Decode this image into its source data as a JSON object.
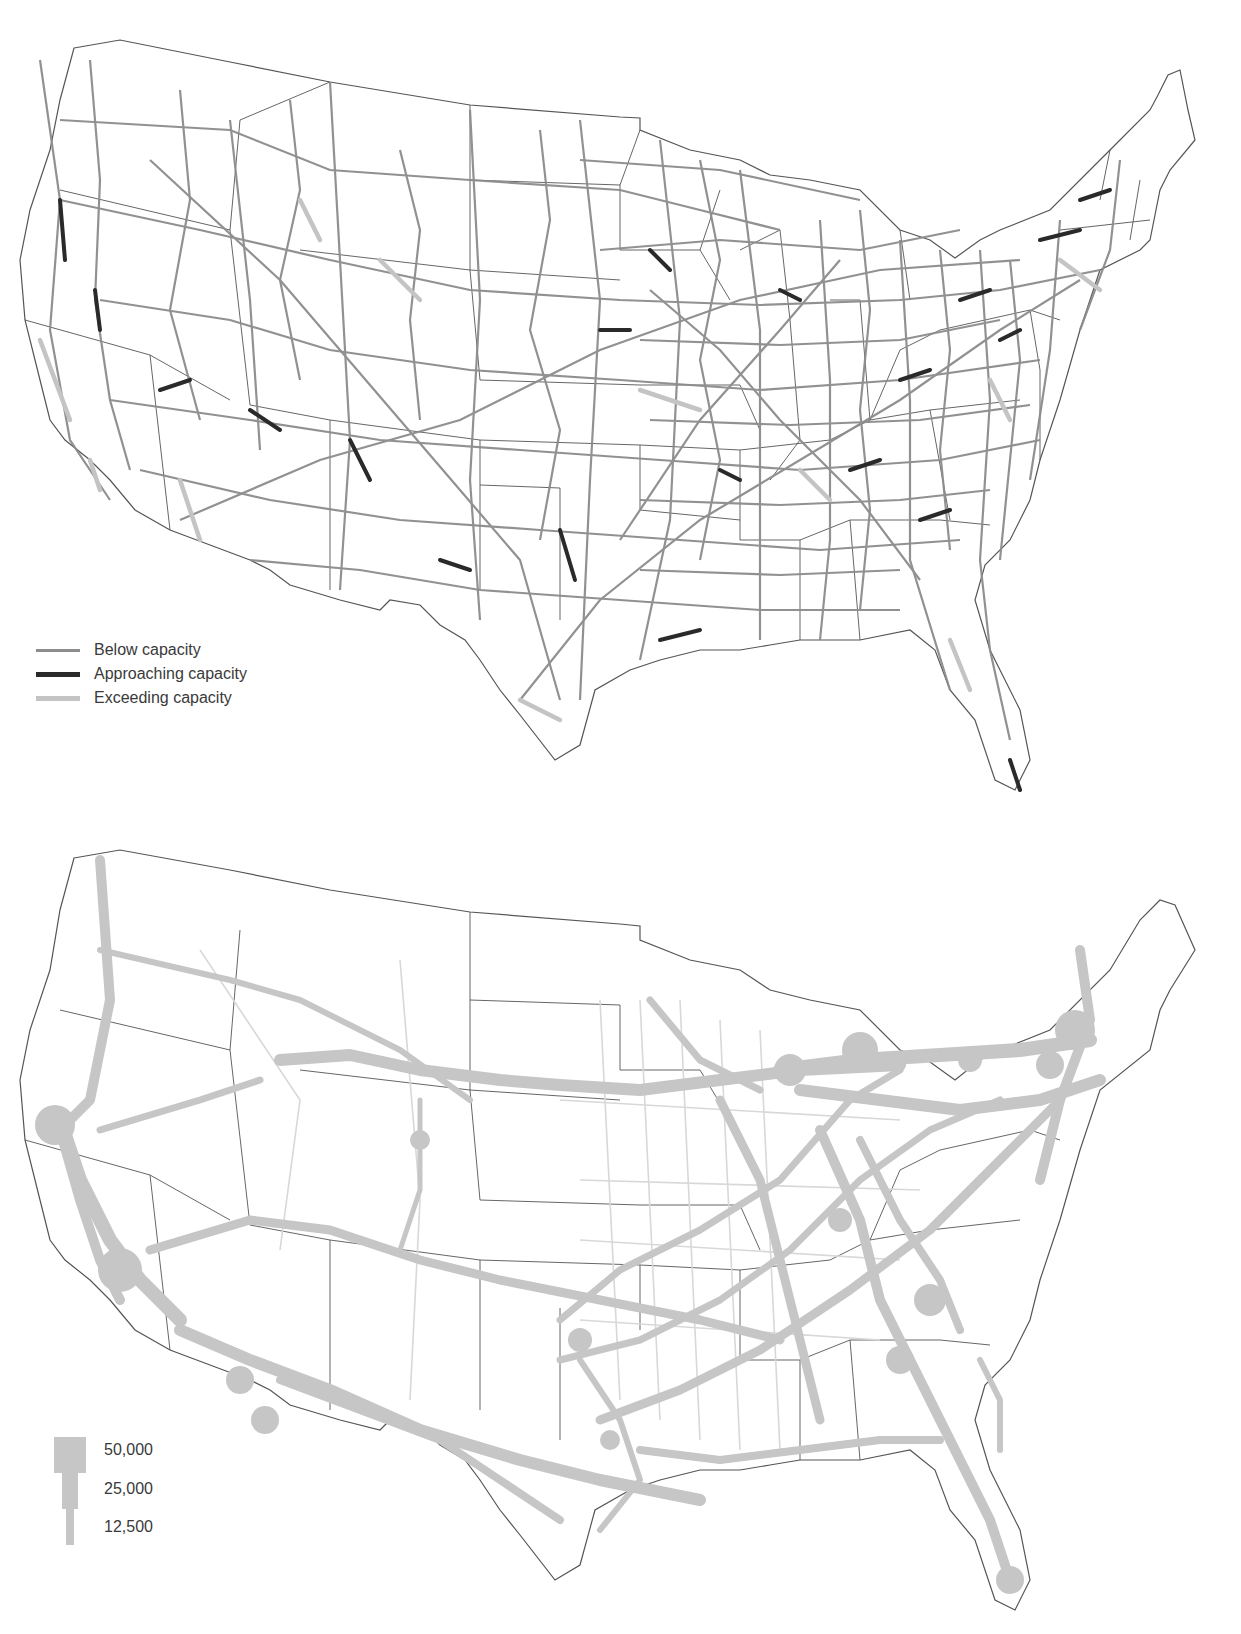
{
  "maps": [
    {
      "id": "capacity",
      "legend": {
        "items": [
          {
            "label": "Below capacity",
            "color": "#8c8c8c",
            "width": 3
          },
          {
            "label": "Approaching capacity",
            "color": "#2a2a2a",
            "width": 5
          },
          {
            "label": "Exceeding capacity",
            "color": "#c4c4c4",
            "width": 5
          }
        ]
      }
    },
    {
      "id": "freight-volume",
      "legend": {
        "flow_color": "#c6c6c6",
        "items": [
          {
            "label": "50,000"
          },
          {
            "label": "25,000"
          },
          {
            "label": "12,500"
          }
        ]
      }
    }
  ],
  "colors": {
    "border": "#444444",
    "below": "#8c8c8c",
    "approaching": "#2a2a2a",
    "exceeding": "#c4c4c4",
    "flow": "#c6c6c6",
    "flow_thin": "#d8d8d8"
  }
}
